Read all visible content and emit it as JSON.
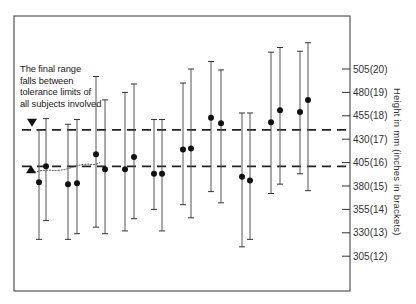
{
  "chart_data": {
    "type": "scatter",
    "subtype": "range-bars-with-points",
    "title": "",
    "annotation": "The final range\nfalls between\ntolerance limits of\nall subjects involved",
    "ylabel": "Height in mm (inches in brackets)",
    "xlabel": "",
    "ylim": [
      250,
      560
    ],
    "y_axis_side": "right",
    "grid": false,
    "yticks": [
      {
        "value": 505,
        "label": "505(20)"
      },
      {
        "value": 480,
        "label": "480(19)"
      },
      {
        "value": 455,
        "label": "455(18)"
      },
      {
        "value": 430,
        "label": "430(17)"
      },
      {
        "value": 405,
        "label": "405(16)"
      },
      {
        "value": 380,
        "label": "380(15)"
      },
      {
        "value": 355,
        "label": "355(14)"
      },
      {
        "value": 330,
        "label": "330(13)"
      },
      {
        "value": 305,
        "label": "305(12)"
      }
    ],
    "reference_lines": [
      {
        "value": 440,
        "style": "dashed",
        "marker": "down-triangle",
        "meaning": "upper limit of final range"
      },
      {
        "value": 401,
        "style": "dashed",
        "marker": "up-triangle",
        "meaning": "lower limit of final range"
      }
    ],
    "series": [
      {
        "name": "subject ranges",
        "points": [
          {
            "top": 440,
            "mid": 384,
            "bottom": 323
          },
          {
            "top": 452,
            "mid": 401,
            "bottom": 343
          },
          {
            "top": 446,
            "mid": 382,
            "bottom": 323
          },
          {
            "top": 451,
            "mid": 383,
            "bottom": 329
          },
          {
            "top": 497,
            "mid": 414,
            "bottom": 336
          },
          {
            "top": 472,
            "mid": 398,
            "bottom": 329
          },
          {
            "top": 480,
            "mid": 398,
            "bottom": 332
          },
          {
            "top": 489,
            "mid": 411,
            "bottom": 345
          },
          {
            "top": 451,
            "mid": 393,
            "bottom": 355
          },
          {
            "top": 451,
            "mid": 393,
            "bottom": 332
          },
          {
            "top": 490,
            "mid": 419,
            "bottom": 360
          },
          {
            "top": 505,
            "mid": 420,
            "bottom": 346
          },
          {
            "top": 513,
            "mid": 453,
            "bottom": 374
          },
          {
            "top": 504,
            "mid": 447,
            "bottom": 362
          },
          {
            "top": 458,
            "mid": 390,
            "bottom": 315
          },
          {
            "top": 458,
            "mid": 386,
            "bottom": 323
          },
          {
            "top": 523,
            "mid": 448,
            "bottom": 372
          },
          {
            "top": 528,
            "mid": 461,
            "bottom": 382
          },
          {
            "top": 524,
            "mid": 459,
            "bottom": 393
          },
          {
            "top": 533,
            "mid": 472,
            "bottom": 375
          }
        ]
      }
    ]
  },
  "geometry": {
    "box": {
      "x": 14,
      "y": 16,
      "w": 336,
      "h": 275
    },
    "y_px_at_505": 69,
    "px_per_mm": 0.936,
    "bar_x": [
      39,
      46,
      68,
      77,
      96,
      105,
      125,
      134,
      154,
      162,
      183,
      191,
      211,
      221,
      242,
      250,
      271,
      280,
      300,
      308
    ]
  }
}
